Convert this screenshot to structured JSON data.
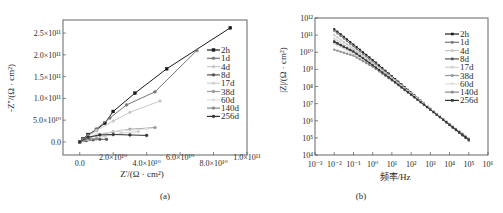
{
  "chart_data": [
    {
      "id": "a",
      "type": "line",
      "title": "",
      "caption": "(a)",
      "xlabel": "Z'/(Ω · cm²)",
      "ylabel": "-Z''/(Ω · cm²)",
      "xlim": [
        -10000000000.0,
        100000000000.0
      ],
      "ylim": [
        -30000000000.0,
        280000000000.0
      ],
      "xticks": [
        0,
        20000000000.0,
        40000000000.0,
        60000000000.0,
        80000000000.0,
        100000000000.0
      ],
      "xtick_labels": [
        "0.0",
        "2.0×10¹⁰",
        "4.0×10¹⁰",
        "6.0×10¹⁰",
        "8.0×10¹⁰",
        "1.0×10¹¹"
      ],
      "yticks": [
        0,
        50000000000.0,
        100000000000.0,
        150000000000.0,
        200000000000.0,
        250000000000.0
      ],
      "ytick_labels": [
        "0.0",
        "5.0×10¹⁰",
        "1.0×10¹¹",
        "1.5×10¹¹",
        "2.0×10¹¹",
        "2.5×10¹¹"
      ],
      "legend_position": "upper right",
      "grid": false,
      "series": [
        {
          "name": "2h",
          "color": "#1a1a1a",
          "marker": "square",
          "x": [
            0,
            2000000000.0,
            5000000000.0,
            10000000000.0,
            15000000000.0,
            20000000000.0,
            33000000000.0,
            52000000000.0,
            90000000000.0
          ],
          "y": [
            0,
            7000000000.0,
            17000000000.0,
            28000000000.0,
            43000000000.0,
            70000000000.0,
            112000000000.0,
            168000000000.0,
            262000000000.0
          ]
        },
        {
          "name": "1d",
          "color": "#777777",
          "marker": "circle",
          "x": [
            0,
            2000000000.0,
            5000000000.0,
            10000000000.0,
            18000000000.0,
            28000000000.0,
            45000000000.0,
            70000000000.0
          ],
          "y": [
            0,
            6000000000.0,
            15000000000.0,
            30000000000.0,
            55000000000.0,
            85000000000.0,
            115000000000.0,
            210000000000.0
          ]
        },
        {
          "name": "4d",
          "color": "#c8c8c8",
          "marker": "triangle",
          "x": [
            0,
            5000000000.0,
            10000000000.0,
            20000000000.0,
            30000000000.0,
            48000000000.0
          ],
          "y": [
            0,
            12000000000.0,
            26000000000.0,
            48000000000.0,
            68000000000.0,
            94000000000.0
          ]
        },
        {
          "name": "8d",
          "color": "#555555",
          "marker": "triangle-down",
          "x": [
            0,
            4000000000.0,
            8000000000.0,
            12000000000.0,
            16000000000.0
          ],
          "y": [
            0,
            3000000000.0,
            5000000000.0,
            6000000000.0,
            6000000000.0
          ]
        },
        {
          "name": "17d",
          "color": "#d0d0d0",
          "marker": "diamond",
          "x": [
            0,
            5000000000.0,
            15000000000.0,
            25000000000.0,
            35000000000.0
          ],
          "y": [
            0,
            5000000000.0,
            13000000000.0,
            20000000000.0,
            24000000000.0
          ]
        },
        {
          "name": "38d",
          "color": "#999999",
          "marker": "triangle-left",
          "x": [
            0,
            10000000000.0,
            20000000000.0,
            30000000000.0,
            45000000000.0
          ],
          "y": [
            0,
            15000000000.0,
            23000000000.0,
            29000000000.0,
            33000000000.0
          ]
        },
        {
          "name": "60d",
          "color": "#e0e0e0",
          "marker": "triangle-right",
          "x": [
            0,
            10000000000.0,
            25000000000.0,
            40000000000.0
          ],
          "y": [
            0,
            18000000000.0,
            26000000000.0,
            30000000000.0
          ]
        },
        {
          "name": "140d",
          "color": "#888888",
          "marker": "hexagon",
          "x": [
            0,
            3000000000.0,
            6000000000.0,
            10000000000.0
          ],
          "y": [
            0,
            4000000000.0,
            6000000000.0,
            7000000000.0
          ]
        },
        {
          "name": "256d",
          "color": "#333333",
          "marker": "star",
          "x": [
            0,
            5000000000.0,
            12000000000.0,
            20000000000.0,
            30000000000.0,
            40000000000.0
          ],
          "y": [
            0,
            11000000000.0,
            16000000000.0,
            17000000000.0,
            16000000000.0,
            15000000000.0
          ]
        }
      ]
    },
    {
      "id": "b",
      "type": "line",
      "title": "",
      "caption": "(b)",
      "xlabel": "频率/Hz",
      "ylabel": "|Z|/(Ω · cm²)",
      "xscale": "log",
      "yscale": "log",
      "xlim_exp": [
        -3,
        6
      ],
      "ylim_exp": [
        4,
        12
      ],
      "xtick_labels": [
        "10⁻³",
        "10⁻²",
        "10⁻¹",
        "10⁰",
        "10¹",
        "10²",
        "10³",
        "10⁴",
        "10⁵",
        "10⁶"
      ],
      "ytick_labels": [
        "10⁴",
        "10⁵",
        "10⁶",
        "10⁷",
        "10⁸",
        "10⁹",
        "10¹⁰",
        "10¹¹",
        "10¹²"
      ],
      "legend_position": "upper right",
      "grid": false,
      "x_exp": [
        -2,
        -1,
        0,
        1,
        2,
        3,
        4,
        5
      ],
      "series": [
        {
          "name": "2h",
          "color": "#1a1a1a",
          "y_exp": [
            11.35,
            10.45,
            9.55,
            8.6,
            7.65,
            6.7,
            5.75,
            4.85
          ]
        },
        {
          "name": "1d",
          "color": "#777777",
          "y_exp": [
            11.25,
            10.35,
            9.45,
            8.55,
            7.62,
            6.68,
            5.75,
            4.88
          ]
        },
        {
          "name": "4d",
          "color": "#c8c8c8",
          "y_exp": [
            11.0,
            10.2,
            9.35,
            8.5,
            7.6,
            6.7,
            5.8,
            4.95
          ]
        },
        {
          "name": "8d",
          "color": "#555555",
          "y_exp": [
            10.65,
            10.0,
            9.25,
            8.4,
            7.55,
            6.65,
            5.78,
            4.92
          ]
        },
        {
          "name": "17d",
          "color": "#d0d0d0",
          "y_exp": [
            10.8,
            10.1,
            9.3,
            8.45,
            7.58,
            6.7,
            5.82,
            4.97
          ]
        },
        {
          "name": "38d",
          "color": "#999999",
          "y_exp": [
            10.55,
            9.95,
            9.2,
            8.38,
            7.52,
            6.66,
            5.8,
            4.95
          ]
        },
        {
          "name": "60d",
          "color": "#e0e0e0",
          "y_exp": [
            10.5,
            9.9,
            9.18,
            8.36,
            7.52,
            6.67,
            5.82,
            4.98
          ]
        },
        {
          "name": "140d",
          "color": "#888888",
          "y_exp": [
            10.15,
            9.8,
            9.15,
            8.35,
            7.5,
            6.64,
            5.78,
            4.93
          ]
        },
        {
          "name": "256d",
          "color": "#333333",
          "y_exp": [
            10.6,
            10.05,
            9.25,
            8.4,
            7.53,
            6.65,
            5.77,
            4.9
          ]
        }
      ]
    }
  ]
}
